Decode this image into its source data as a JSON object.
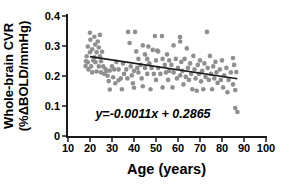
{
  "figure": {
    "background": "#ffffff"
  },
  "chart_data": {
    "type": "scatter",
    "title": "",
    "xlabel": "Age (years)",
    "ylabel_line1": "Whole-brain CVR",
    "ylabel_line2": "(%ΔBOLD/mmHg)",
    "xlim": [
      10,
      100
    ],
    "ylim": [
      0,
      0.4
    ],
    "x_ticks": [
      10,
      20,
      30,
      40,
      50,
      60,
      70,
      80,
      90,
      100
    ],
    "y_ticks": [
      0,
      0.1,
      0.2,
      0.3,
      0.4
    ],
    "y_tick_labels": [
      "0",
      "0.1",
      "0.2",
      "0.3",
      "0.4"
    ],
    "grid": false,
    "legend": "none",
    "annotation": "y=-0.0011x + 0.2865",
    "regression": {
      "slope": -0.0011,
      "intercept": 0.2865,
      "x_start": 20,
      "x_end": 87
    },
    "point_color": "#8f8f8f",
    "line_color": "#1a1a1a",
    "axis_color": "#1a1a1a",
    "text_color": "#000000",
    "points": [
      [
        18,
        0.233
      ],
      [
        18.2,
        0.249
      ],
      [
        18.5,
        0.266
      ],
      [
        19,
        0.298
      ],
      [
        19,
        0.246
      ],
      [
        19.3,
        0.222
      ],
      [
        20,
        0.344
      ],
      [
        20,
        0.279
      ],
      [
        20.2,
        0.321
      ],
      [
        20.5,
        0.232
      ],
      [
        21,
        0.289
      ],
      [
        21,
        0.212
      ],
      [
        21.5,
        0.252
      ],
      [
        22,
        0.331
      ],
      [
        22,
        0.262
      ],
      [
        22.3,
        0.305
      ],
      [
        22.5,
        0.246
      ],
      [
        23,
        0.279
      ],
      [
        23,
        0.215
      ],
      [
        23.5,
        0.315
      ],
      [
        24,
        0.295
      ],
      [
        24,
        0.232
      ],
      [
        24.5,
        0.337
      ],
      [
        24.5,
        0.266
      ],
      [
        25,
        0.249
      ],
      [
        25,
        0.212
      ],
      [
        25.5,
        0.281
      ],
      [
        26,
        0.232
      ],
      [
        26.5,
        0.207
      ],
      [
        27,
        0.223
      ],
      [
        27.5,
        0.217
      ],
      [
        28,
        0.201
      ],
      [
        28.5,
        0.183
      ],
      [
        29,
        0.218
      ],
      [
        29,
        0.155
      ],
      [
        30,
        0.232
      ],
      [
        30.5,
        0.196
      ],
      [
        31,
        0.222
      ],
      [
        31.5,
        0.176
      ],
      [
        32,
        0.247
      ],
      [
        33,
        0.222
      ],
      [
        33,
        0.186
      ],
      [
        34,
        0.192
      ],
      [
        34.5,
        0.156
      ],
      [
        35,
        0.242
      ],
      [
        35.5,
        0.207
      ],
      [
        36.5,
        0.222
      ],
      [
        37,
        0.192
      ],
      [
        37.3,
        0.347
      ],
      [
        38,
        0.31
      ],
      [
        38.5,
        0.232
      ],
      [
        39,
        0.202
      ],
      [
        39.5,
        0.176
      ],
      [
        40,
        0.217
      ],
      [
        40,
        0.161
      ],
      [
        40.5,
        0.347
      ],
      [
        41,
        0.282
      ],
      [
        41.5,
        0.227
      ],
      [
        42,
        0.257
      ],
      [
        42,
        0.212
      ],
      [
        43,
        0.237
      ],
      [
        43.5,
        0.192
      ],
      [
        44,
        0.302
      ],
      [
        44,
        0.166
      ],
      [
        45,
        0.272
      ],
      [
        45,
        0.227
      ],
      [
        46,
        0.257
      ],
      [
        46,
        0.207
      ],
      [
        46.5,
        0.298
      ],
      [
        47,
        0.242
      ],
      [
        47.5,
        0.156
      ],
      [
        48,
        0.227
      ],
      [
        48.5,
        0.287
      ],
      [
        49,
        0.207
      ],
      [
        49.5,
        0.333
      ],
      [
        50,
        0.252
      ],
      [
        50,
        0.187
      ],
      [
        50.5,
        0.285
      ],
      [
        51,
        0.282
      ],
      [
        51,
        0.227
      ],
      [
        52,
        0.207
      ],
      [
        52.7,
        0.333
      ],
      [
        53,
        0.257
      ],
      [
        53,
        0.162
      ],
      [
        54,
        0.237
      ],
      [
        54.5,
        0.212
      ],
      [
        55,
        0.272
      ],
      [
        55.5,
        0.187
      ],
      [
        56,
        0.252
      ],
      [
        56,
        0.217
      ],
      [
        57,
        0.237
      ],
      [
        57.5,
        0.162
      ],
      [
        58,
        0.302
      ],
      [
        58,
        0.212
      ],
      [
        59,
        0.257
      ],
      [
        59.5,
        0.192
      ],
      [
        60,
        0.227
      ],
      [
        60.9,
        0.33
      ],
      [
        61,
        0.202
      ],
      [
        61,
        0.315
      ],
      [
        61.5,
        0.247
      ],
      [
        62,
        0.217
      ],
      [
        62.5,
        0.172
      ],
      [
        63,
        0.257
      ],
      [
        63.5,
        0.197
      ],
      [
        64,
        0.292
      ],
      [
        64.5,
        0.227
      ],
      [
        65,
        0.187
      ],
      [
        65.5,
        0.242
      ],
      [
        66,
        0.207
      ],
      [
        66.5,
        0.156
      ],
      [
        67,
        0.267
      ],
      [
        67.5,
        0.222
      ],
      [
        68,
        0.192
      ],
      [
        68.5,
        0.151
      ],
      [
        69,
        0.237
      ],
      [
        69.5,
        0.207
      ],
      [
        70,
        0.252
      ],
      [
        70.5,
        0.182
      ],
      [
        71,
        0.217
      ],
      [
        71.5,
        0.156
      ],
      [
        72,
        0.242
      ],
      [
        72.5,
        0.197
      ],
      [
        73.2,
        0.347
      ],
      [
        73.5,
        0.227
      ],
      [
        74,
        0.187
      ],
      [
        74.5,
        0.267
      ],
      [
        75,
        0.207
      ],
      [
        75.5,
        0.156
      ],
      [
        76,
        0.232
      ],
      [
        76.5,
        0.192
      ],
      [
        77,
        0.247
      ],
      [
        77.5,
        0.212
      ],
      [
        78,
        0.177
      ],
      [
        79,
        0.222
      ],
      [
        79.5,
        0.187
      ],
      [
        80,
        0.252
      ],
      [
        80.5,
        0.162
      ],
      [
        81,
        0.202
      ],
      [
        82,
        0.227
      ],
      [
        82.5,
        0.146
      ],
      [
        83,
        0.187
      ],
      [
        84,
        0.212
      ],
      [
        85,
        0.26
      ],
      [
        85,
        0.172
      ],
      [
        85.5,
        0.237
      ],
      [
        86,
        0.153
      ],
      [
        86,
        0.093
      ],
      [
        86.5,
        0.213
      ],
      [
        87,
        0.08
      ]
    ]
  }
}
